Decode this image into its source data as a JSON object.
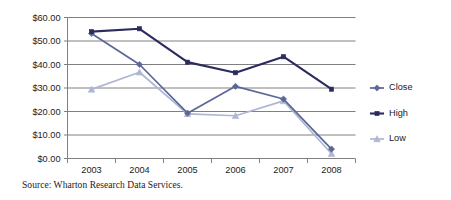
{
  "chart_data": {
    "type": "line",
    "title": "",
    "xlabel": "",
    "ylabel": "",
    "categories": [
      "2003",
      "2004",
      "2005",
      "2006",
      "2007",
      "2008"
    ],
    "series": [
      {
        "name": "Close",
        "color": "#5b6699",
        "marker": "diamond",
        "values": [
          53.2,
          40.0,
          19.3,
          30.7,
          25.3,
          4.0
        ]
      },
      {
        "name": "High",
        "color": "#2b2b5f",
        "marker": "square",
        "values": [
          54.0,
          55.2,
          41.0,
          36.5,
          43.3,
          29.5
        ]
      },
      {
        "name": "Low",
        "color": "#aeb7d2",
        "marker": "triangle",
        "values": [
          29.4,
          36.7,
          19.0,
          18.2,
          24.5,
          2.0
        ]
      }
    ],
    "ylim": [
      0,
      60
    ],
    "yticks": [
      0,
      10,
      20,
      30,
      40,
      50,
      60
    ],
    "ytick_labels": [
      "$0.00",
      "$10.00",
      "$20.00",
      "$30.00",
      "$40.00",
      "$50.00",
      "$60.00"
    ],
    "grid": true,
    "grid_axis": "y",
    "grid_color": "#808080",
    "legend_position": "right",
    "legend_entries": [
      "Close",
      "High",
      "Low"
    ],
    "source_note": "Source: Wharton Research Data Services."
  }
}
